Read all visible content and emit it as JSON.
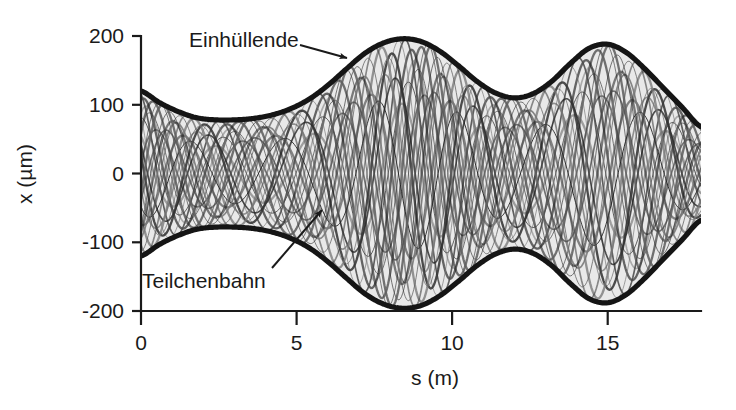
{
  "figure": {
    "kind": "beam-envelope-plot",
    "background": "#ffffff",
    "ink_color": "#151515",
    "beam_fill_color": "#e9e9e9"
  },
  "axes": {
    "x": {
      "title": "s (m)",
      "ticks": [
        "0",
        "5",
        "10",
        "15"
      ],
      "tick_values": [
        0,
        5,
        10,
        15
      ],
      "range": [
        0,
        18
      ]
    },
    "y": {
      "title": "x (µm)",
      "ticks": [
        "200",
        "100",
        "0",
        "-100",
        "-200"
      ],
      "tick_values": [
        200,
        100,
        0,
        -100,
        -200
      ],
      "range": [
        -200,
        200
      ]
    }
  },
  "annotations": [
    {
      "id": "envelope",
      "label": "Einhüllende",
      "label_x": 189,
      "label_y": 47,
      "arrow_from": [
        300,
        45
      ],
      "arrow_to": [
        347,
        58
      ]
    },
    {
      "id": "trajectory",
      "label": "Teilchenbahn",
      "label_x": 142,
      "label_y": 288,
      "arrow_from": [
        272,
        268
      ],
      "arrow_to": [
        322,
        210
      ]
    }
  ],
  "chart_data": {
    "type": "line",
    "title": "",
    "subtitle": "",
    "xlabel": "s (m)",
    "ylabel": "x (µm)",
    "xlim": [
      0,
      18
    ],
    "ylim": [
      -200,
      200
    ],
    "grid": false,
    "legend": "none",
    "annotations": [
      "Einhüllende",
      "Teilchenbahn"
    ],
    "series": [
      {
        "name": "Einhüllende (upper envelope)",
        "x": [
          0.0,
          0.6,
          1.2,
          1.8,
          2.4,
          3.0,
          3.6,
          4.2,
          4.8,
          5.4,
          6.0,
          6.6,
          7.2,
          7.8,
          8.4,
          9.0,
          9.6,
          10.2,
          10.8,
          11.4,
          12.0,
          12.6,
          13.2,
          13.8,
          14.4,
          15.0,
          15.6,
          16.2,
          16.8,
          17.4,
          18.0
        ],
        "values": [
          120,
          103,
          90,
          81,
          78,
          78,
          80,
          85,
          94,
          108,
          128,
          152,
          175,
          190,
          196,
          192,
          178,
          157,
          134,
          117,
          110,
          116,
          134,
          160,
          182,
          188,
          176,
          152,
          124,
          96,
          68
        ]
      },
      {
        "name": "Einhüllende (lower envelope)",
        "x": [
          0.0,
          0.6,
          1.2,
          1.8,
          2.4,
          3.0,
          3.6,
          4.2,
          4.8,
          5.4,
          6.0,
          6.6,
          7.2,
          7.8,
          8.4,
          9.0,
          9.6,
          10.2,
          10.8,
          11.4,
          12.0,
          12.6,
          13.2,
          13.8,
          14.4,
          15.0,
          15.6,
          16.2,
          16.8,
          17.4,
          18.0
        ],
        "values": [
          -120,
          -103,
          -90,
          -81,
          -78,
          -78,
          -80,
          -85,
          -94,
          -108,
          -128,
          -152,
          -175,
          -190,
          -196,
          -192,
          -178,
          -157,
          -134,
          -117,
          -110,
          -116,
          -134,
          -160,
          -182,
          -188,
          -176,
          -152,
          -124,
          -96,
          -68
        ]
      },
      {
        "name": "Teilchenbahnen (particle trajectories)",
        "count": 24,
        "description": "Betatron oscillations of individual particles, each bounded by the envelope; phase advance ≈ 2.2 rad per metre, amplitudes scaled by the envelope function."
      }
    ]
  }
}
